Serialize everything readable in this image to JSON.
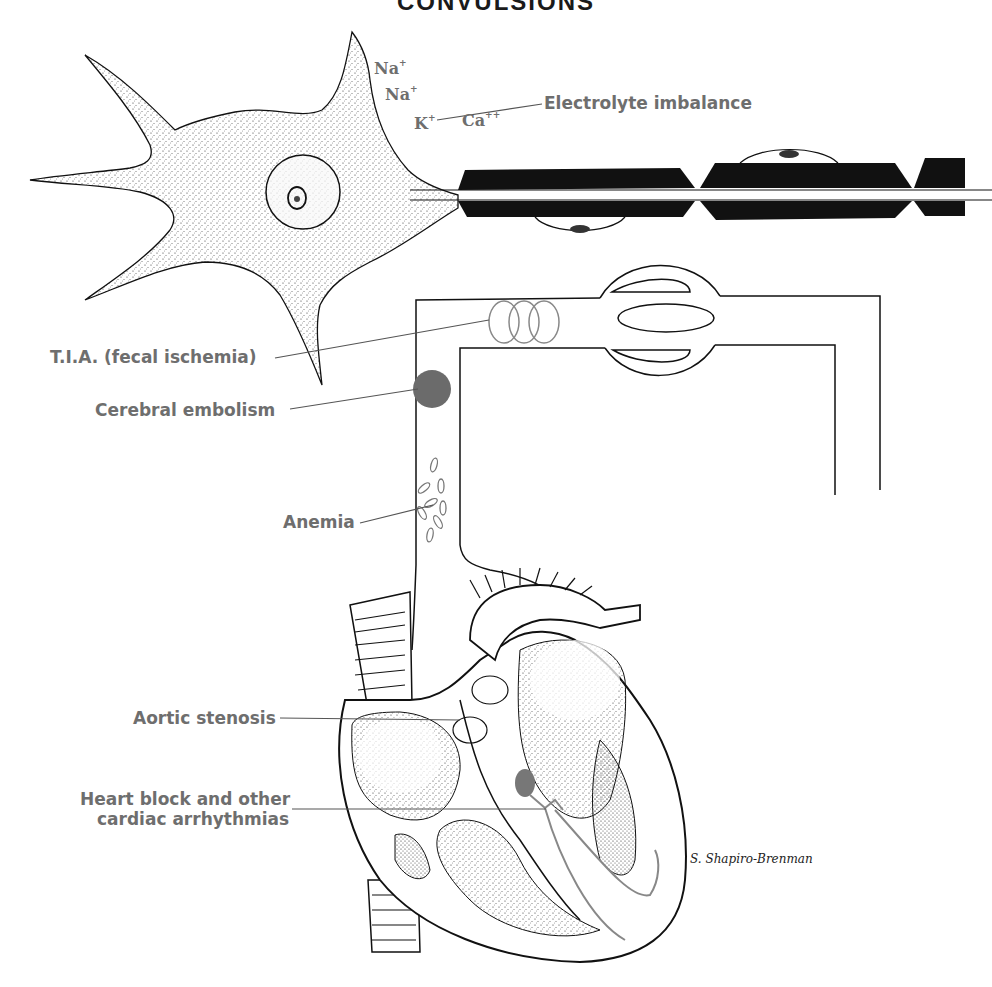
{
  "title": "CONVULSIONS",
  "ions": {
    "na1": {
      "symbol": "Na",
      "charge": "+"
    },
    "na2": {
      "symbol": "Na",
      "charge": "+"
    },
    "k": {
      "symbol": "K",
      "charge": "+"
    },
    "ca": {
      "symbol": "Ca",
      "charge": "++"
    }
  },
  "labels": {
    "electrolyte": "Electrolyte imbalance",
    "tia": "T.I.A. (fecal ischemia)",
    "embolism": "Cerebral embolism",
    "anemia": "Anemia",
    "aortic": "Aortic stenosis",
    "heart_block_line1": "Heart block and other",
    "heart_block_line2": "cardiac arrhythmias"
  },
  "signature": "S. Shapiro-Brenman",
  "colors": {
    "label_gray": "#6e6e6e",
    "line_black": "#111111",
    "embolus_fill": "#6b6b6b",
    "myelin": "#111111"
  }
}
